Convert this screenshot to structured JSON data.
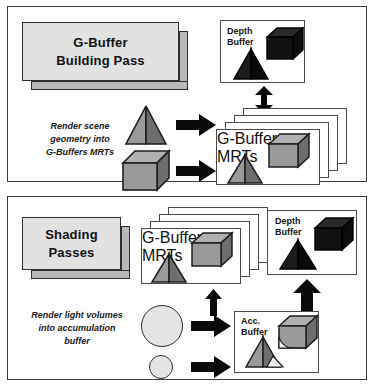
{
  "diagram": {
    "type": "flow-diagram",
    "panels": [
      {
        "id": "g-buffer-building-pass",
        "label": "G-Buffer\nBuilding Pass",
        "note": "Render scene\ngeometry into\nG-Buffers MRTs",
        "buffers": [
          {
            "id": "depth-buffer-top",
            "caption": "Depth\nBuffer",
            "contents": [
              "black-cube",
              "black-pyramid"
            ]
          },
          {
            "id": "g-buffer-mrts-top",
            "caption": "G-Buffer\nMRTs",
            "contents": [
              "gray-cube",
              "gray-pyramid"
            ],
            "stack_count": 4
          }
        ],
        "inputs": [
          "gray-pyramid",
          "gray-cube"
        ],
        "arrows": [
          {
            "id": "arrow-pyramid-to-mrts",
            "direction": "right"
          },
          {
            "id": "arrow-cube-to-mrts",
            "direction": "right"
          },
          {
            "id": "arrow-depth-mrts-link",
            "direction": "both"
          }
        ]
      },
      {
        "id": "shading-passes",
        "label": "Shading\nPasses",
        "note": "Render light volumes\ninto accumulation\nbuffer",
        "buffers": [
          {
            "id": "g-buffer-mrts-bottom",
            "caption": "G-Buffer\nMRTs",
            "contents": [
              "gray-cube",
              "gray-pyramid"
            ],
            "stack_count": 4
          },
          {
            "id": "depth-buffer-bottom",
            "caption": "Depth\nBuffer",
            "contents": [
              "black-cube",
              "black-pyramid"
            ]
          },
          {
            "id": "acc-buffer",
            "caption": "Acc.\nBuffer",
            "contents": [
              "lit-cube",
              "lit-pyramid"
            ]
          }
        ],
        "inputs": [
          "large-light-circle",
          "small-light-circle"
        ],
        "arrows": [
          {
            "id": "arrow-large-light-to-acc",
            "direction": "right"
          },
          {
            "id": "arrow-small-light-to-acc",
            "direction": "right"
          },
          {
            "id": "arrow-acc-to-mrts",
            "direction": "up"
          },
          {
            "id": "arrow-acc-to-depth",
            "direction": "up"
          }
        ]
      }
    ],
    "colors": {
      "slab_face": "#e2e2e2",
      "slab_side": "#b9b9b9",
      "shape_light_face": "#9a9a9a",
      "shape_dark_face": "#6e6e6e",
      "shape_top_face": "#b0b0b0",
      "black_shape": "#0d0d0d",
      "black_shape_top": "#2a2a2a",
      "light_circle": "#e4e4e4",
      "lit_highlight": "#f2f2f2",
      "border": "#3a3a3a",
      "arrow": "#0a0a0a",
      "panel_bg": "#fdfdfd"
    }
  }
}
